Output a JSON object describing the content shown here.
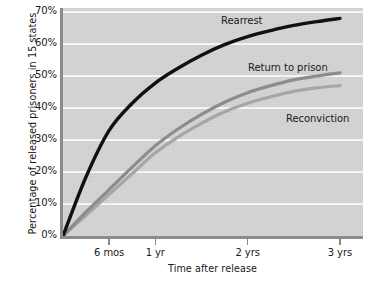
{
  "chart_data": {
    "type": "line",
    "title": "",
    "xlabel": "Time after release",
    "ylabel": "Percentage of released prisoners in 15 states",
    "x_tick_labels": [
      "6 mos",
      "1 yr",
      "2 yrs",
      "3 yrs"
    ],
    "x_tick_values": [
      0.5,
      1,
      2,
      3
    ],
    "xlim": [
      0,
      3.25
    ],
    "y_tick_labels": [
      "0%",
      "10%",
      "20%",
      "30%",
      "40%",
      "50%",
      "60%",
      "70%"
    ],
    "y_tick_values": [
      0,
      10,
      20,
      30,
      40,
      50,
      60,
      70
    ],
    "ylim": [
      0,
      71.25
    ],
    "grid": "horizontal",
    "legend_position": "inline-annotations",
    "plot_background": "#d4d4d4",
    "series": [
      {
        "name": "Rearrest",
        "color": "#111111",
        "x": [
          0,
          0.25,
          0.5,
          0.75,
          1.0,
          1.25,
          1.5,
          1.75,
          2.0,
          2.25,
          2.5,
          2.75,
          3.0
        ],
        "values": [
          0,
          18.5,
          33.0,
          41.5,
          47.8,
          52.5,
          56.5,
          59.8,
          62.3,
          64.2,
          65.8,
          67.0,
          68.0
        ]
      },
      {
        "name": "Return to prison",
        "color": "#8c8c8c",
        "x": [
          0,
          0.25,
          0.5,
          0.75,
          1.0,
          1.25,
          1.5,
          1.75,
          2.0,
          2.25,
          2.5,
          2.75,
          3.0
        ],
        "values": [
          0,
          7.5,
          14.5,
          21.5,
          28.2,
          33.5,
          38.0,
          41.8,
          44.8,
          47.0,
          48.8,
          50.0,
          51.0
        ]
      },
      {
        "name": "Reconviction",
        "color": "#a6a6a6",
        "x": [
          0,
          0.25,
          0.5,
          0.75,
          1.0,
          1.25,
          1.5,
          1.75,
          2.0,
          2.25,
          2.5,
          2.75,
          3.0
        ],
        "values": [
          0,
          6.5,
          13.0,
          19.5,
          26.0,
          31.0,
          35.2,
          38.8,
          41.5,
          43.5,
          45.2,
          46.3,
          47.0
        ]
      }
    ],
    "annotations": [
      {
        "text": "Rearrest",
        "x_px": 221,
        "y_px": 15
      },
      {
        "text": "Return to prison",
        "x_px": 248,
        "y_px": 62
      },
      {
        "text": "Reconviction",
        "x_px": 286,
        "y_px": 113
      }
    ]
  }
}
